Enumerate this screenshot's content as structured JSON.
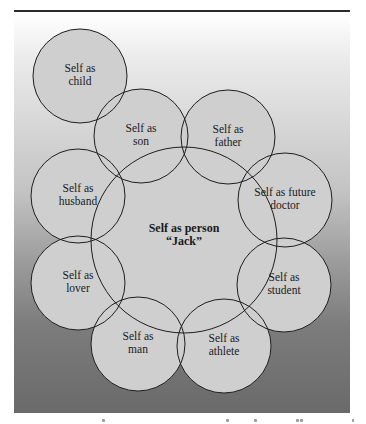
{
  "diagram": {
    "colors": {
      "circle_fill": "#cfcfcf",
      "circle_stroke": "#1e1e1e",
      "text": "#1a1a1a",
      "rule": "#2a2a2a"
    },
    "center": {
      "line1": "Self as person",
      "line2": "“Jack”",
      "cx": 184,
      "cy": 240,
      "r": 93
    },
    "circles": [
      {
        "id": "child",
        "line1": "Self as",
        "line2": "child",
        "cx": 80,
        "cy": 76,
        "r": 47
      },
      {
        "id": "son",
        "line1": "Self as",
        "line2": "son",
        "cx": 141,
        "cy": 136,
        "r": 47
      },
      {
        "id": "father",
        "line1": "Self as",
        "line2": "father",
        "cx": 228,
        "cy": 137,
        "r": 47
      },
      {
        "id": "future-doctor",
        "line1": "Self as future",
        "line2": "doctor",
        "cx": 285,
        "cy": 200,
        "r": 47
      },
      {
        "id": "student",
        "line1": "Self as",
        "line2": "student",
        "cx": 284,
        "cy": 285,
        "r": 47
      },
      {
        "id": "athlete",
        "line1": "Self as",
        "line2": "athlete",
        "cx": 224,
        "cy": 346,
        "r": 47
      },
      {
        "id": "man",
        "line1": "Self as",
        "line2": "man",
        "cx": 138,
        "cy": 344,
        "r": 47
      },
      {
        "id": "lover",
        "line1": "Self as",
        "line2": "lover",
        "cx": 78,
        "cy": 283,
        "r": 47
      },
      {
        "id": "husband",
        "line1": "Self as",
        "line2": "husband",
        "cx": 78,
        "cy": 196,
        "r": 47
      }
    ]
  }
}
